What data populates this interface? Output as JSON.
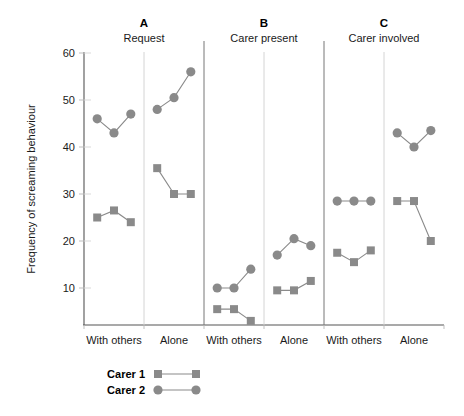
{
  "chart_data": {
    "type": "line",
    "title": "",
    "xlabel": "",
    "ylabel": "Frequency of screaming behaviour",
    "ylim": [
      0,
      60
    ],
    "yticks": [
      10,
      20,
      30,
      40,
      50,
      60
    ],
    "ytick_labels": [
      "10",
      "20",
      "30",
      "40",
      "50",
      "60"
    ],
    "grid": false,
    "legend_position": "bottom-left",
    "legend": [
      {
        "name": "Carer 1",
        "marker": "square",
        "color": "#8a8a8a"
      },
      {
        "name": "Carer 2",
        "marker": "circle",
        "color": "#8a8a8a"
      }
    ],
    "panels": [
      {
        "letter": "A",
        "subtitle": "Request",
        "conditions": [
          {
            "label": "With others",
            "x": [
              1,
              2,
              3
            ],
            "series": [
              {
                "name": "Carer 1",
                "marker": "square",
                "values": [
                  25,
                  26.5,
                  24
                ]
              },
              {
                "name": "Carer 2",
                "marker": "circle",
                "values": [
                  46,
                  43,
                  47
                ]
              }
            ]
          },
          {
            "label": "Alone",
            "x": [
              4,
              5,
              6
            ],
            "series": [
              {
                "name": "Carer 1",
                "marker": "square",
                "values": [
                  35.5,
                  30,
                  30
                ]
              },
              {
                "name": "Carer 2",
                "marker": "circle",
                "values": [
                  48,
                  50.5,
                  56
                ]
              }
            ]
          }
        ]
      },
      {
        "letter": "B",
        "subtitle": "Carer present",
        "conditions": [
          {
            "label": "With others",
            "x": [
              1,
              2,
              3
            ],
            "series": [
              {
                "name": "Carer 1",
                "marker": "square",
                "values": [
                  5.5,
                  5.5,
                  3
                ]
              },
              {
                "name": "Carer 2",
                "marker": "circle",
                "values": [
                  10,
                  10,
                  14
                ]
              }
            ]
          },
          {
            "label": "Alone",
            "x": [
              4,
              5,
              6
            ],
            "series": [
              {
                "name": "Carer 1",
                "marker": "square",
                "values": [
                  9.5,
                  9.5,
                  11.5
                ]
              },
              {
                "name": "Carer 2",
                "marker": "circle",
                "values": [
                  17,
                  20.5,
                  19
                ]
              }
            ]
          }
        ]
      },
      {
        "letter": "C",
        "subtitle": "Carer involved",
        "conditions": [
          {
            "label": "With others",
            "x": [
              1,
              2,
              3
            ],
            "series": [
              {
                "name": "Carer 1",
                "marker": "square",
                "values": [
                  17.5,
                  15.5,
                  18
                ]
              },
              {
                "name": "Carer 2",
                "marker": "circle",
                "values": [
                  28.5,
                  28.5,
                  28.5
                ]
              }
            ]
          },
          {
            "label": "Alone",
            "x": [
              4,
              5,
              6
            ],
            "series": [
              {
                "name": "Carer 1",
                "marker": "square",
                "values": [
                  28.5,
                  28.5,
                  20
                ]
              },
              {
                "name": "Carer 2",
                "marker": "circle",
                "values": [
                  43,
                  40,
                  43.5
                ]
              }
            ]
          }
        ]
      }
    ]
  }
}
